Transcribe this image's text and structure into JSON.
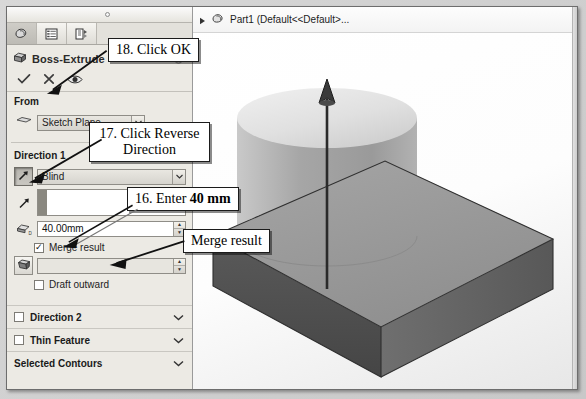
{
  "window": {
    "feature_tree": {
      "expand_icon": "triangle-right-icon",
      "part_icon": "part-icon",
      "label": "Part1 (Default<<Default>..."
    }
  },
  "property_manager": {
    "tabs": [
      {
        "name": "feature-manager-tab",
        "icon": "feature-tree-icon",
        "active": true
      },
      {
        "name": "property-manager-tab",
        "icon": "property-list-icon",
        "active": false
      },
      {
        "name": "configuration-manager-tab",
        "icon": "configuration-icon",
        "active": false
      }
    ],
    "title": "Boss-Extrude",
    "help_icon": "help-icon",
    "actions": [
      {
        "name": "ok-button",
        "icon": "check-icon"
      },
      {
        "name": "cancel-button",
        "icon": "x-icon"
      },
      {
        "name": "preview-button",
        "icon": "eye-icon"
      }
    ],
    "from": {
      "heading": "From",
      "start_condition": "Sketch Plane"
    },
    "direction1": {
      "heading": "Direction 1",
      "reverse_direction_icon": "reverse-direction-arrow-icon",
      "end_condition": "Blind",
      "direction_vector_icon": "direction-arrow-icon",
      "direction_vector_value": "",
      "depth_icon": "depth-icon",
      "depth_value": "40.00mm",
      "merge_result_label": "Merge result",
      "merge_result_checked": true,
      "draft_icon": "draft-angle-icon",
      "draft_value": "",
      "draft_outward_label": "Draft outward",
      "draft_outward_checked": false
    },
    "collapsed_sections": [
      {
        "label": "Direction 2",
        "underline_char": "2",
        "has_checkbox": true,
        "chevron": "chevron-down-icon"
      },
      {
        "label": "Thin Feature",
        "underline_char": "T",
        "has_checkbox": true,
        "chevron": "chevron-down-icon"
      },
      {
        "label": "Selected Contours",
        "underline_char": "S",
        "has_checkbox": false,
        "chevron": "chevron-down-icon"
      }
    ]
  },
  "callouts": [
    {
      "name": "callout-click-ok",
      "text": "18. Click OK"
    },
    {
      "name": "callout-click-reverse",
      "text": "17. Click Reverse Direction"
    },
    {
      "name": "callout-enter-40mm",
      "prefix": "16. Enter ",
      "bold": "40 mm"
    },
    {
      "name": "callout-merge-result",
      "text": "Merge result"
    }
  ],
  "graphics": {
    "model_description": "isometric-extrude-preview",
    "colors": {
      "plate_top": "#9a9a9a",
      "plate_front": "#4f4f4f",
      "plate_side": "#6e6e6e",
      "cylinder_body": "#a8a8a8",
      "cylinder_top": "#e2e2e2",
      "background": "#ffffff"
    },
    "direction_arrow_icon": "extrude-direction-arrow-icon"
  }
}
